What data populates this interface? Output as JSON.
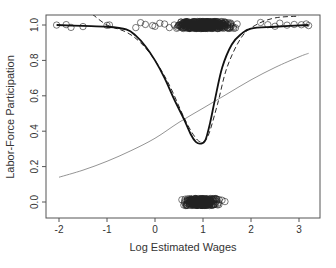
{
  "chart_data": {
    "type": "scatter",
    "title": "",
    "xlabel": "Log Estimated Wages",
    "ylabel": "Labor-Force Participation",
    "xlim": [
      -2.2,
      3.4
    ],
    "ylim": [
      -0.05,
      1.05
    ],
    "x_ticks": [
      -2,
      -1,
      0,
      1,
      2,
      3
    ],
    "x_tick_labels": [
      "-2",
      "-1",
      "0",
      "1",
      "2",
      "3"
    ],
    "y_ticks": [
      0.0,
      0.2,
      0.4,
      0.6,
      0.8,
      1.0
    ],
    "y_tick_labels": [
      "0.0",
      "0.2",
      "0.4",
      "0.6",
      "0.8",
      "1.0"
    ],
    "grid": false,
    "legend": null,
    "series": [
      {
        "name": "nonparametric fit (solid)",
        "style": "solid-black-thick",
        "x": [
          -2.05,
          -1.5,
          -1.0,
          -0.6,
          -0.4,
          -0.2,
          0.0,
          0.2,
          0.4,
          0.6,
          0.75,
          0.85,
          0.95,
          1.05,
          1.15,
          1.25,
          1.4,
          1.6,
          1.8,
          2.0,
          2.5,
          3.2
        ],
        "y": [
          1.0,
          0.995,
          0.99,
          0.975,
          0.94,
          0.88,
          0.8,
          0.7,
          0.58,
          0.47,
          0.38,
          0.34,
          0.33,
          0.35,
          0.45,
          0.58,
          0.76,
          0.89,
          0.95,
          0.98,
          0.99,
          1.0
        ]
      },
      {
        "name": "alternative fit (dashed)",
        "style": "dashed-black",
        "x": [
          -1.3,
          -1.0,
          -0.6,
          -0.3,
          0.0,
          0.3,
          0.6,
          0.8,
          0.95,
          1.1,
          1.3,
          1.5,
          1.8,
          2.1,
          2.5,
          3.0
        ],
        "y": [
          1.06,
          1.0,
          0.96,
          0.9,
          0.8,
          0.66,
          0.48,
          0.38,
          0.34,
          0.37,
          0.55,
          0.76,
          0.93,
          1.0,
          1.04,
          1.05
        ]
      },
      {
        "name": "linear logit fit (gray)",
        "style": "solid-gray-thin",
        "x": [
          -2.0,
          -1.5,
          -1.0,
          -0.5,
          0.0,
          0.5,
          1.0,
          1.5,
          2.0,
          2.5,
          3.0,
          3.2
        ],
        "y": [
          0.14,
          0.18,
          0.23,
          0.29,
          0.36,
          0.45,
          0.53,
          0.61,
          0.69,
          0.76,
          0.82,
          0.84
        ]
      },
      {
        "name": "participants (y=1, jittered)",
        "style": "open-circles",
        "x_range": [
          -2.05,
          3.2
        ],
        "y_center": 1.0,
        "density_peak": 1.0,
        "note": "sparse below 0, dense from 0.5 to 2.0"
      },
      {
        "name": "non-participants (y=0, jittered)",
        "style": "open-circles",
        "x_range": [
          0.1,
          1.8
        ],
        "y_center": 0.0,
        "density_peak": 1.0
      }
    ]
  },
  "axes": {
    "xlabel": "Log Estimated Wages",
    "ylabel": "Labor-Force Participation"
  },
  "colors": {
    "background": "#ffffff",
    "frame": "#555555",
    "main_curve": "#111111",
    "logit_curve": "#888888",
    "points": "#222222"
  }
}
